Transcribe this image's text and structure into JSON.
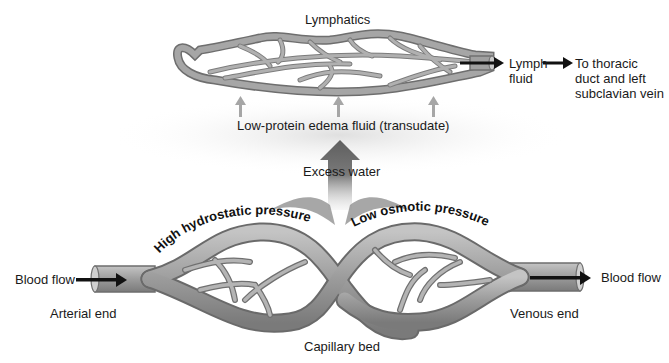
{
  "diagram": {
    "labels": {
      "lymphatics": "Lymphatics",
      "lymph_fluid_1": "Lymph",
      "lymph_fluid_2": "fluid",
      "thoracic_1": "To thoracic",
      "thoracic_2": "duct and left",
      "thoracic_3": "subclavian vein",
      "edema_fluid": "Low-protein edema fluid (transudate)",
      "excess_water": "Excess water",
      "high_pressure": "High hydrostatic pressure",
      "low_pressure": "Low osmotic pressure",
      "blood_flow_in": "Blood flow",
      "blood_flow_out": "Blood flow",
      "arterial_end": "Arterial end",
      "venous_end": "Venous end",
      "capillary_bed": "Capillary bed"
    },
    "colors": {
      "vessel": "#9a9a9a",
      "vessel_dark": "#6e6e6e",
      "vessel_light": "#bdbdbd",
      "arrow": "#111111",
      "small_arrow": "#a8a8a8",
      "big_arrow": "#707070"
    }
  }
}
